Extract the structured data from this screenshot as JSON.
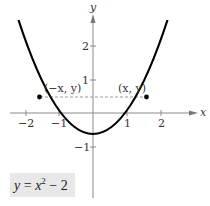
{
  "diagram": {
    "function_label": {
      "y": "y",
      "eq": "=",
      "x": "x",
      "exp": "2",
      "rest": "− 2"
    },
    "axes": {
      "x_label": "x",
      "y_label": "y"
    },
    "x_ticks": [
      {
        "value": -2,
        "label": "−2"
      },
      {
        "value": -1,
        "label": "−1"
      },
      {
        "value": 1,
        "label": "1"
      },
      {
        "value": 2,
        "label": "2"
      }
    ],
    "y_ticks": [
      {
        "value": 2,
        "label": "2"
      },
      {
        "value": 1,
        "label": "1"
      },
      {
        "value": -1,
        "label": "−1"
      }
    ],
    "points": {
      "left": {
        "label": "(−x, y)"
      },
      "right": {
        "label": "(x, y)"
      }
    },
    "colors": {
      "curve": "#000000",
      "axes": "#888888",
      "dashed": "#999999",
      "label_bg": "#e8e8e8"
    }
  }
}
